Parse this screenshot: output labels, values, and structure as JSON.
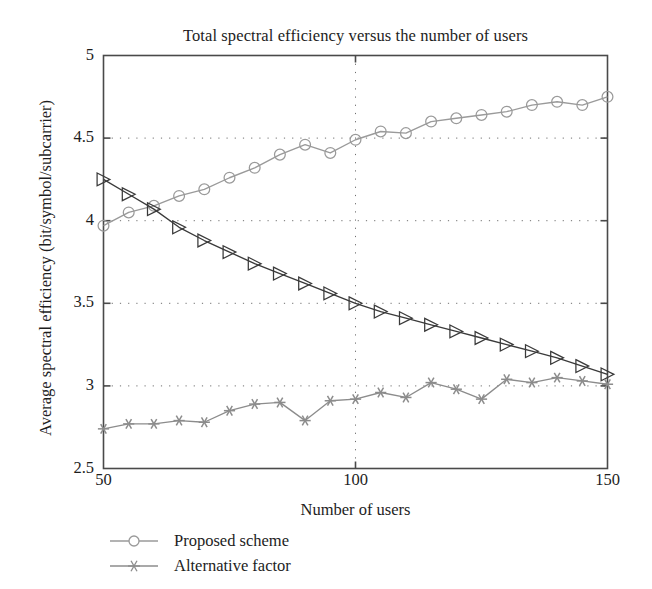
{
  "chart_data": {
    "type": "line",
    "title": "Total spectral efficiency versus the number of users",
    "xlabel": "Number of users",
    "ylabel": "Average spectral efficiency (bit/symbol/subcarrier)",
    "xlim": [
      50,
      150
    ],
    "ylim": [
      2.5,
      5
    ],
    "xticks": [
      50,
      100,
      150
    ],
    "yticks": [
      2.5,
      3,
      3.5,
      4,
      4.5,
      5
    ],
    "xtick_labels": [
      "50",
      "100",
      "150"
    ],
    "ytick_labels": [
      "2.5",
      "3",
      "3.5",
      "4",
      "4.5",
      "5"
    ],
    "grid": "dotted",
    "legend_position": "below-axes-left",
    "x": [
      50,
      55,
      60,
      65,
      70,
      75,
      80,
      85,
      90,
      95,
      100,
      105,
      110,
      115,
      120,
      125,
      130,
      135,
      140,
      145,
      150
    ],
    "series": [
      {
        "name": "Proposed scheme",
        "marker": "circle",
        "color": "#9a9a9a",
        "in_legend": true,
        "values": [
          3.97,
          4.05,
          4.09,
          4.15,
          4.19,
          4.26,
          4.32,
          4.4,
          4.46,
          4.41,
          4.49,
          4.54,
          4.53,
          4.6,
          4.62,
          4.64,
          4.66,
          4.7,
          4.72,
          4.7,
          4.75
        ]
      },
      {
        "name": "Reference curve",
        "marker": "triangle-right",
        "color": "#3a3a3a",
        "in_legend": false,
        "values": [
          4.25,
          4.16,
          4.07,
          3.96,
          3.88,
          3.81,
          3.74,
          3.68,
          3.62,
          3.56,
          3.5,
          3.45,
          3.41,
          3.37,
          3.33,
          3.29,
          3.25,
          3.21,
          3.17,
          3.12,
          3.07
        ]
      },
      {
        "name": "Alternative factor",
        "marker": "asterisk",
        "color": "#8c8c8c",
        "in_legend": true,
        "values": [
          2.74,
          2.77,
          2.77,
          2.79,
          2.78,
          2.85,
          2.89,
          2.9,
          2.79,
          2.91,
          2.92,
          2.96,
          2.93,
          3.02,
          2.98,
          2.92,
          3.04,
          3.02,
          3.05,
          3.03,
          3.01
        ]
      }
    ]
  },
  "legend": {
    "items": [
      {
        "label": "Proposed scheme"
      },
      {
        "label": "Alternative factor"
      }
    ]
  }
}
